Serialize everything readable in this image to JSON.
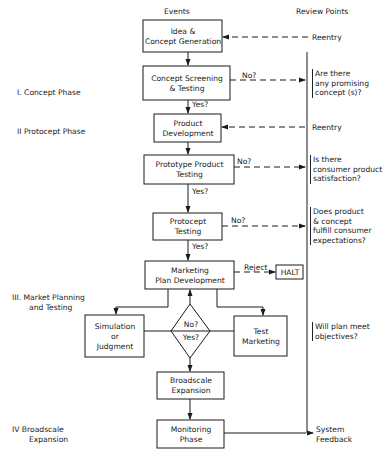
{
  "headers": {
    "events": "Events",
    "review_points": "Review Points"
  },
  "phases": [
    {
      "numeral": "I.",
      "label": "Concept Phase"
    },
    {
      "numeral": "II",
      "label": "Protocept Phase"
    },
    {
      "numeral": "III.",
      "label_line1": "Market Planning",
      "label_line2": "and Testing"
    },
    {
      "numeral": "IV",
      "label_line1": "Broadscale",
      "label_line2": "Expansion"
    }
  ],
  "boxes": {
    "idea": {
      "line1": "Idea &",
      "line2": "Concept Generation"
    },
    "screening": {
      "line1": "Concept Screening",
      "line2": "& Testing"
    },
    "product_dev": {
      "line1": "Product",
      "line2": "Development"
    },
    "prototype": {
      "line1": "Prototype Product",
      "line2": "Testing"
    },
    "protocept": {
      "line1": "Protocept",
      "line2": "Testing"
    },
    "marketing_plan": {
      "line1": "Marketing",
      "line2": "Plan Development"
    },
    "halt": {
      "label": "HALT"
    },
    "simulation": {
      "line1": "Simulation",
      "line2": "or",
      "line3": "Judgment"
    },
    "test_marketing": {
      "line1": "Test",
      "line2": "Marketing"
    },
    "decision": {
      "top": "No?",
      "bottom": "Yes?"
    },
    "broadscale": {
      "line1": "Broadscale",
      "line2": "Expansion"
    },
    "monitoring": {
      "line1": "Monitoring",
      "line2": "Phase"
    }
  },
  "edge_labels": {
    "no1": "No?",
    "yes1": "Yes?",
    "no2": "No?",
    "yes2": "Yes?",
    "no3": "No?",
    "yes3": "Yes?",
    "reject": "Reject"
  },
  "review": {
    "reentry1": "Reentry",
    "q1": [
      "Are there",
      "any promising",
      "concept (s)?"
    ],
    "reentry2": "Reentry",
    "q2": [
      "Is there",
      "consumer product",
      "satisfaction?"
    ],
    "q3": [
      "Does product",
      "& concept",
      "fulfill consumer",
      "expectations?"
    ],
    "q4": [
      "Will plan meet",
      "objectives?"
    ],
    "feedback_line1": "System",
    "feedback_line2": "Feedback"
  },
  "colors": {
    "ink": "#1a1a1a",
    "background": "#ffffff"
  }
}
